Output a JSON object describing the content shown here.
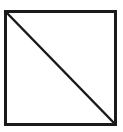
{
  "diagram": {
    "shape": "square-with-diagonal",
    "stroke_color": "#1a1a1a",
    "fill_color": "#ffffff",
    "square": {
      "x": 5,
      "y": 11,
      "width": 111,
      "height": 114
    },
    "diagonal": {
      "from": "top-left",
      "to": "bottom-right"
    }
  }
}
